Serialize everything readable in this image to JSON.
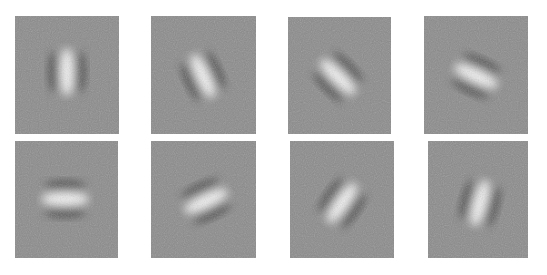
{
  "figure": {
    "background_gray": "#8a8a8a",
    "panels": [
      {
        "row": 0,
        "col": 0,
        "x": 15,
        "y": 16,
        "w": 104,
        "h": 118,
        "angle_deg": 0,
        "cx": 52,
        "cy": 56
      },
      {
        "row": 0,
        "col": 1,
        "x": 151,
        "y": 16,
        "w": 105,
        "h": 118,
        "angle_deg": -25,
        "cx": 52,
        "cy": 60
      },
      {
        "row": 0,
        "col": 2,
        "x": 288,
        "y": 17,
        "w": 103,
        "h": 117,
        "angle_deg": -45,
        "cx": 50,
        "cy": 60
      },
      {
        "row": 0,
        "col": 3,
        "x": 424,
        "y": 16,
        "w": 104,
        "h": 118,
        "angle_deg": -65,
        "cx": 52,
        "cy": 60
      },
      {
        "row": 1,
        "col": 0,
        "x": 15,
        "y": 141,
        "w": 103,
        "h": 117,
        "angle_deg": -90,
        "cx": 50,
        "cy": 58
      },
      {
        "row": 1,
        "col": 1,
        "x": 151,
        "y": 141,
        "w": 105,
        "h": 117,
        "angle_deg": 65,
        "cx": 55,
        "cy": 60
      },
      {
        "row": 1,
        "col": 2,
        "x": 290,
        "y": 141,
        "w": 104,
        "h": 117,
        "angle_deg": 35,
        "cx": 52,
        "cy": 62
      },
      {
        "row": 1,
        "col": 3,
        "x": 428,
        "y": 141,
        "w": 100,
        "h": 117,
        "angle_deg": 15,
        "cx": 52,
        "cy": 62
      }
    ]
  }
}
